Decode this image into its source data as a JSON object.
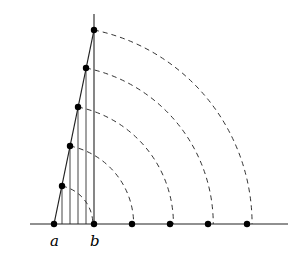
{
  "diagram": {
    "origin": {
      "x": 54,
      "y": 224
    },
    "baseline": {
      "x1": 30,
      "x2": 288,
      "y": 224
    },
    "vertical_axis": {
      "x": 94,
      "y1": 14,
      "y2": 224
    },
    "slanted_line": {
      "x1": 54,
      "y1": 224,
      "x2": 94,
      "y2": 30
    },
    "slant_points": [
      {
        "x": 62,
        "y": 186
      },
      {
        "x": 70,
        "y": 146
      },
      {
        "x": 78,
        "y": 107
      },
      {
        "x": 86,
        "y": 68
      },
      {
        "x": 94,
        "y": 30
      }
    ],
    "baseline_points": [
      54,
      94,
      132,
      170,
      208,
      247
    ],
    "labels": {
      "a": "a",
      "b": "b"
    },
    "stroke_color": "#000000",
    "line_color": "#222222"
  }
}
